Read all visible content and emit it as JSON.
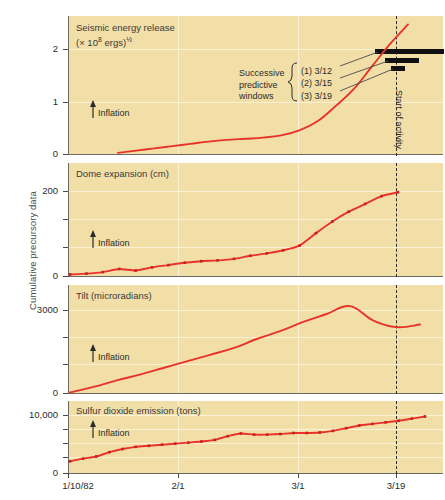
{
  "figure": {
    "y_axis_label": "Cumulative precursory data",
    "background_color": "#f2dfa8",
    "series_color": "#e8332a",
    "marker_color": "#c8201a"
  },
  "x_axis": {
    "ticks": [
      "1/10/82",
      "2/1",
      "3/1",
      "3/19"
    ],
    "tick_positions_px": [
      68,
      178,
      298,
      396
    ]
  },
  "annotations": {
    "successive_label_line1": "Successive",
    "successive_label_line2": "predictive",
    "successive_label_line3": "windows",
    "window_1": "(1) 3/12",
    "window_2": "(2) 3/15",
    "window_3": "(3) 3/19",
    "start_of_activity": "Start of activity",
    "inflation": "Inflation"
  },
  "chart_data": [
    {
      "type": "line",
      "panel_index": 0,
      "title": "Seismic energy release (× 10⁸ ergs)½",
      "title_main": "Seismic energy release",
      "title_units_prefix": "(× 10",
      "title_units_exp": "8",
      "title_units_mid": " ergs)",
      "title_units_frac": "½",
      "xlabel": "",
      "ylabel": "(× 10^8 ergs)^1/2",
      "ylim": [
        0,
        2.45
      ],
      "yticks": [
        0,
        1,
        2
      ],
      "ytick_labels": [
        "0",
        "1",
        "2"
      ],
      "grid": true,
      "markers": false,
      "x": [
        "1/25",
        "1/29",
        "2/3",
        "2/8",
        "2/14",
        "2/20",
        "2/25",
        "3/1",
        "3/5",
        "3/9",
        "3/12",
        "3/14",
        "3/16",
        "3/17",
        "3/18",
        "3/19",
        "3/19.5"
      ],
      "y": [
        0.02,
        0.06,
        0.1,
        0.14,
        0.18,
        0.22,
        0.25,
        0.27,
        0.29,
        0.33,
        0.42,
        0.58,
        0.85,
        1.15,
        1.55,
        1.95,
        2.3
      ]
    },
    {
      "type": "line",
      "panel_index": 1,
      "title": "Dome expansion (cm)",
      "xlabel": "",
      "ylabel": "Dome expansion (cm)",
      "ylim": [
        0,
        290
      ],
      "yticks": [
        0,
        200
      ],
      "ytick_labels": [
        "0",
        "200"
      ],
      "grid": true,
      "markers": true,
      "x": [
        "1/10",
        "1/16",
        "1/24",
        "1/30",
        "2/4",
        "2/9",
        "2/14",
        "2/18",
        "2/22",
        "2/26",
        "3/1",
        "3/4",
        "3/7",
        "3/10",
        "3/12",
        "3/14",
        "3/15",
        "3/16",
        "3/17",
        "3/18",
        "3/19"
      ],
      "y": [
        4,
        6,
        10,
        18,
        14,
        22,
        28,
        34,
        38,
        40,
        44,
        52,
        58,
        66,
        78,
        110,
        140,
        165,
        185,
        205,
        215
      ]
    },
    {
      "type": "line",
      "panel_index": 2,
      "title": "Tilt (microradians)",
      "xlabel": "",
      "ylabel": "Tilt (microradians)",
      "ylim": [
        0,
        4100
      ],
      "yticks": [
        0,
        3000
      ],
      "ytick_labels": [
        "0",
        "3000"
      ],
      "grid": true,
      "markers": false,
      "x": [
        "1/10",
        "1/20",
        "2/1",
        "2/10",
        "2/20",
        "3/1",
        "3/6",
        "3/10",
        "3/13",
        "3/15",
        "3/17",
        "3/18",
        "3/18.6",
        "3/19",
        "3/19.4",
        "3/20"
      ],
      "y": [
        20,
        230,
        480,
        700,
        950,
        1200,
        1450,
        1700,
        2050,
        2350,
        2700,
        3000,
        3300,
        2750,
        2500,
        2600
      ]
    },
    {
      "type": "line",
      "panel_index": 3,
      "title": "Sulfur dioxide emission (tons)",
      "xlabel": "",
      "ylabel": "Sulfur dioxide emission (tons)",
      "ylim": [
        0,
        13500
      ],
      "yticks": [
        0,
        10000
      ],
      "ytick_labels": [
        "0",
        "10,000"
      ],
      "grid": true,
      "markers": true,
      "x": [
        "1/10",
        "1/13",
        "1/18",
        "1/24",
        "1/30",
        "2/3",
        "2/5",
        "2/7",
        "2/9",
        "2/11",
        "2/13",
        "2/16",
        "2/20",
        "2/24",
        "2/26",
        "2/28",
        "3/2",
        "3/4",
        "3/6",
        "3/8",
        "3/11",
        "3/13",
        "3/15",
        "3/16",
        "3/17",
        "3/18",
        "3/19",
        "3/20"
      ],
      "y": [
        2200,
        2700,
        3100,
        3900,
        4500,
        4900,
        5100,
        5300,
        5500,
        5700,
        5900,
        6200,
        6900,
        7400,
        7200,
        7200,
        7300,
        7500,
        7500,
        7600,
        7900,
        8400,
        8900,
        9200,
        9500,
        9800,
        10200,
        10600
      ]
    }
  ],
  "predictive_windows": [
    {
      "label": "(1) 3/12",
      "x_start_px": 375,
      "x_end_px": 444,
      "y_px": 51
    },
    {
      "label": "(2) 3/15",
      "x_start_px": 385,
      "x_end_px": 419,
      "y_px": 60
    },
    {
      "label": "(3) 3/19",
      "x_start_px": 391,
      "x_end_px": 405,
      "y_px": 68
    }
  ]
}
